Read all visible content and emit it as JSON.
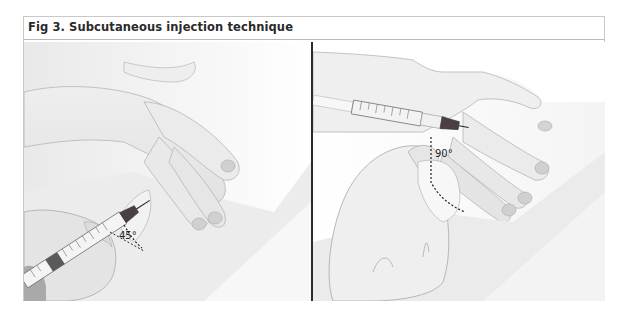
{
  "figure": {
    "title": "Fig 3. Subcutaneous injection technique",
    "panels": [
      {
        "id": "left",
        "description": "Syringe inserted into pinched skin at an angle",
        "angle_label": "45°"
      },
      {
        "id": "right",
        "description": "Syringe inserted into pinched skin perpendicular",
        "angle_label": "90°"
      }
    ]
  },
  "colors": {
    "border": "#c9c9c9",
    "divider": "#2b2b2b",
    "skin_shadow": "#d9d9d9",
    "syringe_plunger": "#5a5a5a",
    "needle_hub": "#4a4040"
  }
}
